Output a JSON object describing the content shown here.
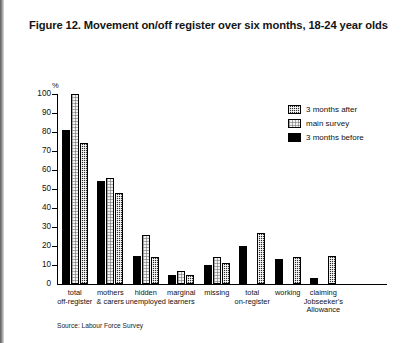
{
  "figure": {
    "title": "Figure 12. Movement on/off register over six months, 18-24 year olds",
    "source": "Source: Labour Force Survey"
  },
  "chart_data": {
    "type": "bar",
    "title": "Figure 12. Movement on/off register over six months, 18-24 year olds",
    "xlabel": "",
    "ylabel": "%",
    "ylim": [
      0,
      100
    ],
    "yticks": [
      0,
      10,
      20,
      30,
      40,
      50,
      60,
      70,
      80,
      90,
      100
    ],
    "grid": false,
    "legend_position": "top-right",
    "categories": [
      "total off-register",
      "mothers & carers",
      "hidden unemployed",
      "marginal learners",
      "missing",
      "total on-register",
      "working",
      "claiming Jobseeker's Allowance"
    ],
    "series": [
      {
        "name": "3 months before",
        "pattern": "solid-black",
        "values": [
          81,
          54,
          15,
          5,
          10,
          20,
          13,
          3
        ]
      },
      {
        "name": "main survey",
        "pattern": "light-dotted",
        "values": [
          100,
          56,
          26,
          7,
          14,
          0,
          0,
          0
        ]
      },
      {
        "name": "3 months after",
        "pattern": "dark-checker",
        "values": [
          74,
          48,
          14,
          5,
          11,
          27,
          14,
          15
        ]
      }
    ]
  },
  "axis": {
    "unit_symbol": "%",
    "tick_labels": [
      "100",
      "90",
      "80",
      "70",
      "60",
      "50",
      "40",
      "30",
      "20",
      "10",
      "0"
    ]
  },
  "legend": {
    "items": [
      {
        "label": "3 months after",
        "pattern": "dark-checker"
      },
      {
        "label": "main survey",
        "pattern": "light-dotted"
      },
      {
        "label": "3 months before",
        "pattern": "solid-black"
      }
    ]
  },
  "category_labels": [
    "total\noff-register",
    "mothers\n& carers",
    "hidden\nunemployed",
    "marginal\nlearners",
    "missing",
    "total\non-register",
    "working",
    "claiming\nJobseeker's\nAllowance"
  ]
}
